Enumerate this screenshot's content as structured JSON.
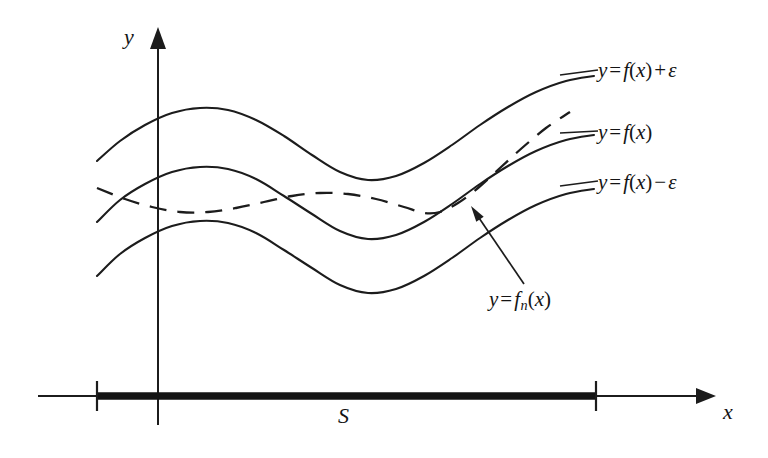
{
  "figure": {
    "background": "#ffffff",
    "ink_color": "#1c1c1c"
  },
  "axes": {
    "x_label": "x",
    "y_label": "y",
    "x_axis": {
      "y": 396,
      "x_start": 38,
      "x_end": 716,
      "arrow": "right"
    },
    "y_axis": {
      "x": 158,
      "y_top": 27,
      "y_bottom": 425,
      "arrow": "up"
    },
    "ticks": [
      {
        "name": "left-endpoint",
        "x": 97,
        "y": 396,
        "half_height": 15
      },
      {
        "name": "right-endpoint",
        "x": 596,
        "y": 396,
        "half_height": 15
      }
    ]
  },
  "interval": {
    "label": "S",
    "x_start": 97,
    "x_end": 596,
    "y": 396,
    "stroke_width": 7.5
  },
  "labels": {
    "upper_curve": {
      "y": "y",
      "eq": "=",
      "f": "f",
      "open": "(",
      "arg": "x",
      "close": ")",
      "op": "+",
      "eps": "ε"
    },
    "middle_curve": {
      "y": "y",
      "eq": "=",
      "f": "f",
      "open": "(",
      "arg": "x",
      "close": ")"
    },
    "lower_curve": {
      "y": "y",
      "eq": "=",
      "f": "f",
      "open": "(",
      "arg": "x",
      "close": ")",
      "op": "−",
      "eps": "ε"
    },
    "dashed_curve": {
      "y": "y",
      "eq": "=",
      "f": "f",
      "sub": "n",
      "open": "(",
      "arg": "x",
      "close": ")"
    }
  },
  "leader_lines": [
    {
      "name": "upper-curve-leader",
      "x1": 560,
      "y1": 75,
      "x2": 598,
      "y2": 70
    },
    {
      "name": "middle-curve-leader",
      "x1": 560,
      "y1": 133,
      "x2": 598,
      "y2": 131
    },
    {
      "name": "lower-curve-leader",
      "x1": 560,
      "y1": 186,
      "x2": 598,
      "y2": 181
    }
  ],
  "annotation_arrow": {
    "name": "fn-pointer",
    "tail_x": 524,
    "tail_y": 284,
    "tip_x": 471,
    "tip_y": 206
  },
  "chart_data": {
    "type": "line",
    "xlabel": "x",
    "ylabel": "y",
    "grid": false,
    "legend": "inline-labels-right",
    "xlim": [
      38,
      716
    ],
    "ylim": [
      27,
      425
    ],
    "note": "Pixel coordinates; y grows downward in screen space.",
    "series": [
      {
        "name": "y = f(x) + ε",
        "style": "solid",
        "points": [
          [
            97,
            161
          ],
          [
            120,
            141
          ],
          [
            145,
            125
          ],
          [
            172,
            113
          ],
          [
            200,
            108
          ],
          [
            228,
            110
          ],
          [
            256,
            120
          ],
          [
            284,
            136
          ],
          [
            312,
            155
          ],
          [
            340,
            172
          ],
          [
            368,
            180
          ],
          [
            396,
            176
          ],
          [
            424,
            163
          ],
          [
            452,
            145
          ],
          [
            480,
            125
          ],
          [
            508,
            107
          ],
          [
            536,
            92
          ],
          [
            566,
            81
          ],
          [
            594,
            76
          ]
        ]
      },
      {
        "name": "y = f(x)",
        "style": "solid",
        "points": [
          [
            97,
            222
          ],
          [
            120,
            200
          ],
          [
            145,
            184
          ],
          [
            172,
            172
          ],
          [
            200,
            167
          ],
          [
            228,
            169
          ],
          [
            256,
            179
          ],
          [
            284,
            196
          ],
          [
            312,
            214
          ],
          [
            340,
            231
          ],
          [
            368,
            239
          ],
          [
            396,
            235
          ],
          [
            424,
            222
          ],
          [
            452,
            204
          ],
          [
            480,
            184
          ],
          [
            508,
            166
          ],
          [
            536,
            151
          ],
          [
            566,
            140
          ],
          [
            594,
            135
          ]
        ]
      },
      {
        "name": "y = f(x) − ε",
        "style": "solid",
        "points": [
          [
            97,
            276
          ],
          [
            120,
            254
          ],
          [
            145,
            238
          ],
          [
            172,
            226
          ],
          [
            200,
            221
          ],
          [
            228,
            223
          ],
          [
            256,
            233
          ],
          [
            284,
            250
          ],
          [
            312,
            268
          ],
          [
            340,
            285
          ],
          [
            368,
            293
          ],
          [
            396,
            289
          ],
          [
            424,
            276
          ],
          [
            452,
            258
          ],
          [
            480,
            238
          ],
          [
            508,
            220
          ],
          [
            536,
            205
          ],
          [
            566,
            194
          ],
          [
            594,
            189
          ]
        ]
      },
      {
        "name": "y = f_n(x)",
        "style": "dashed",
        "points": [
          [
            97,
            188
          ],
          [
            125,
            199
          ],
          [
            152,
            207
          ],
          [
            180,
            212
          ],
          [
            208,
            212
          ],
          [
            236,
            208
          ],
          [
            264,
            202
          ],
          [
            292,
            196
          ],
          [
            320,
            193
          ],
          [
            348,
            194
          ],
          [
            376,
            199
          ],
          [
            404,
            207
          ],
          [
            424,
            213
          ],
          [
            440,
            212
          ],
          [
            458,
            203
          ],
          [
            478,
            188
          ],
          [
            500,
            168
          ],
          [
            522,
            148
          ],
          [
            546,
            128
          ],
          [
            570,
            112
          ]
        ]
      }
    ]
  }
}
